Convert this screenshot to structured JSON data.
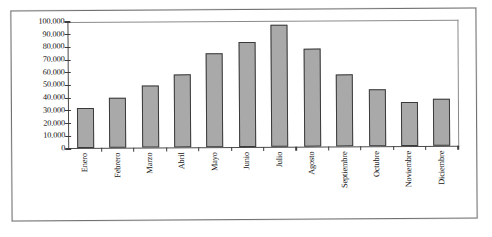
{
  "chart_data": {
    "type": "bar",
    "title": "",
    "subtitle": "",
    "xlabel": "",
    "ylabel": "",
    "categories": [
      "Enero",
      "Febrero",
      "Marzo",
      "Abril",
      "Mayo",
      "Junio",
      "Julio",
      "Agosto",
      "Septiembre",
      "Octubre",
      "Noviembre",
      "Diciembre"
    ],
    "values": [
      32000,
      40000,
      49500,
      58000,
      74500,
      83500,
      96500,
      78000,
      57000,
      45500,
      35000,
      37500
    ],
    "ylim": [
      0,
      100000
    ],
    "ytick_values": [
      100000,
      90000,
      80000,
      70000,
      60000,
      50000,
      40000,
      30000,
      20000,
      10000,
      0
    ],
    "ytick_labels": [
      "100.000",
      "90.000",
      "80.000",
      "70.000",
      "60.000",
      "50.000",
      "40.000",
      "30.000",
      "20.000",
      "10.000",
      "0"
    ],
    "grid": false,
    "legend": null,
    "legend_position": "none",
    "bar_fill_color": "#a9a9a9",
    "bar_border_color": "#3a3a3a",
    "axis_color": "#4a4a4a",
    "background_color": "#ffffff",
    "xtick_label_rotation": -90,
    "number_format": "es-ES (period as thousands separator)"
  },
  "frame": {
    "border_color": "#6f6f6f"
  }
}
